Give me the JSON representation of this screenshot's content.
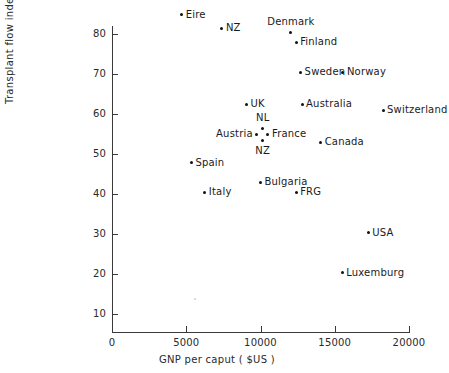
{
  "chart_data": {
    "type": "scatter",
    "title": "",
    "xlabel": "GNP per caput  ( $US )",
    "ylabel": "Transplant flow index",
    "xlim": [
      0,
      20000
    ],
    "ylim": [
      0,
      85
    ],
    "xticks": [
      0,
      5000,
      10000,
      15000,
      20000
    ],
    "xticklabels": [
      "0",
      "5000",
      "10000",
      "15000",
      "20000"
    ],
    "yticks": [
      10,
      20,
      30,
      40,
      50,
      60,
      70,
      80
    ],
    "yticklabels": [
      "10",
      "20",
      "30",
      "40",
      "50",
      "60",
      "70",
      "80"
    ],
    "grid": false,
    "legend": false,
    "points": [
      {
        "label": "Eire",
        "x": 4700,
        "y": 84.8,
        "label_pos": "right"
      },
      {
        "label": "NZ",
        "x": 7400,
        "y": 81.5,
        "label_pos": "right"
      },
      {
        "label": "Denmark",
        "x": 12050,
        "y": 80.5,
        "label_pos": "above"
      },
      {
        "label": "Finland",
        "x": 12400,
        "y": 78.0,
        "label_pos": "right"
      },
      {
        "label": "Sweden",
        "x": 12700,
        "y": 70.5,
        "label_pos": "right"
      },
      {
        "label": "Norway",
        "x": 15550,
        "y": 70.5,
        "label_pos": "right"
      },
      {
        "label": "UK",
        "x": 9050,
        "y": 62.5,
        "label_pos": "right"
      },
      {
        "label": "Australia",
        "x": 12800,
        "y": 62.5,
        "label_pos": "right"
      },
      {
        "label": "Switzerland",
        "x": 18250,
        "y": 61.0,
        "label_pos": "right"
      },
      {
        "label": "NL",
        "x": 10150,
        "y": 56.5,
        "label_pos": "above"
      },
      {
        "label": "Austria",
        "x": 9750,
        "y": 55.0,
        "label_pos": "left"
      },
      {
        "label": "France",
        "x": 10500,
        "y": 55.0,
        "label_pos": "right"
      },
      {
        "label": "NZ",
        "x": 10150,
        "y": 53.5,
        "label_pos": "below"
      },
      {
        "label": "Canada",
        "x": 14050,
        "y": 53.0,
        "label_pos": "right"
      },
      {
        "label": "Spain",
        "x": 5350,
        "y": 47.8,
        "label_pos": "right"
      },
      {
        "label": "Bulgaria",
        "x": 10000,
        "y": 43.0,
        "label_pos": "right"
      },
      {
        "label": "Italy",
        "x": 6250,
        "y": 40.5,
        "label_pos": "right"
      },
      {
        "label": "FRG",
        "x": 12400,
        "y": 40.5,
        "label_pos": "right"
      },
      {
        "label": "USA",
        "x": 17250,
        "y": 30.3,
        "label_pos": "right"
      },
      {
        "label": "Luxemburg",
        "x": 15500,
        "y": 20.3,
        "label_pos": "right"
      },
      {
        "label": "",
        "x": 5600,
        "y": 13.8,
        "label_pos": "right",
        "faint": true
      }
    ]
  },
  "colors": {
    "point": "#111111",
    "axis": "#3a3a3a",
    "text": "#1a1a1a",
    "background": "#ffffff",
    "faint_point": "#cfcfcf"
  }
}
